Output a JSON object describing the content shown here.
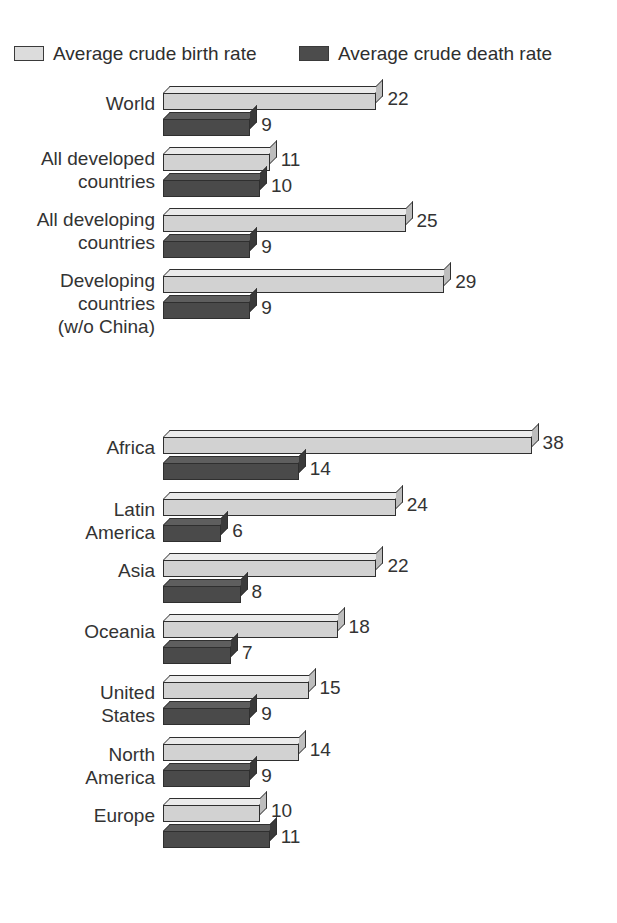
{
  "legend": {
    "entries": [
      {
        "label": "Average crude birth rate",
        "swatch": "light",
        "color": "#dcdcdc"
      },
      {
        "label": "Average crude death rate",
        "swatch": "dark",
        "color": "#4c4c4c"
      }
    ]
  },
  "chart_data": {
    "type": "bar",
    "orientation": "horizontal",
    "title": "",
    "subtitle": "",
    "xlabel": "",
    "ylabel": "",
    "grid": false,
    "legend_position": "top",
    "xlim": [
      0,
      38
    ],
    "categories": [
      "World",
      "All developed\ncountries",
      "All developing\ncountries",
      "Developing\ncountries\n(w/o China)",
      "Africa",
      "Latin\nAmerica",
      "Asia",
      "Oceania",
      "United\nStates",
      "North\nAmerica",
      "Europe"
    ],
    "series": [
      {
        "name": "Average crude birth rate",
        "color": "#d2d2d2",
        "values": [
          22,
          11,
          25,
          29,
          38,
          24,
          22,
          18,
          15,
          14,
          10
        ]
      },
      {
        "name": "Average crude death rate",
        "color": "#4a4a4a",
        "values": [
          9,
          10,
          9,
          9,
          14,
          6,
          8,
          7,
          9,
          9,
          11
        ]
      }
    ],
    "data_labels": [
      {
        "category": "World",
        "birth": "22",
        "death": "9"
      },
      {
        "category": "All developed countries",
        "birth": "11",
        "death": "10"
      },
      {
        "category": "All developing countries",
        "birth": "25",
        "death": "9"
      },
      {
        "category": "Developing countries (w/o China)",
        "birth": "29",
        "death": "9"
      },
      {
        "category": "Africa",
        "birth": "38",
        "death": "14"
      },
      {
        "category": "Latin America",
        "birth": "24",
        "death": "6"
      },
      {
        "category": "Asia",
        "birth": "22",
        "death": "8"
      },
      {
        "category": "Oceania",
        "birth": "18",
        "death": "7"
      },
      {
        "category": "United States",
        "birth": "15",
        "death": "9"
      },
      {
        "category": "North America",
        "birth": "14",
        "death": "9"
      },
      {
        "category": "Europe",
        "birth": "10",
        "death": "11"
      }
    ]
  },
  "layout": {
    "group_tops": [
      86,
      147,
      208,
      269,
      430,
      492,
      553,
      614,
      675,
      737,
      798
    ],
    "label_tops": [
      92,
      147,
      208,
      269,
      436,
      498,
      559,
      620,
      681,
      743,
      804
    ],
    "px_per_unit": 9.7,
    "bar_origin_x": 163
  }
}
